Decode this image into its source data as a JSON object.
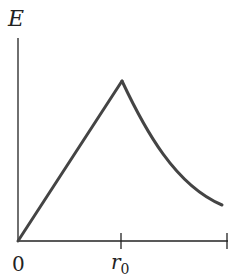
{
  "diagram": {
    "y_axis_label": "E",
    "x_tick_labels": {
      "origin": "0",
      "r0_base": "r",
      "r0_sub": "0"
    },
    "curve": {
      "description": "Linear rise from 0 to peak at r0, then decaying curve beyond r0",
      "color": "#444444"
    },
    "axis_color": "#222222"
  }
}
